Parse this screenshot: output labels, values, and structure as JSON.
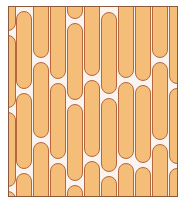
{
  "pattern": {
    "description": "Staggered capsule tile pattern",
    "colors": {
      "background": "#FBF3F0",
      "fill": "#F5BE78",
      "outline": "#B5683E",
      "frame": "#8B5A3C"
    },
    "frame": {
      "x": 8,
      "y": 6,
      "width": 170,
      "height": 191
    },
    "column_width": 16,
    "columns": [
      {
        "x": -9,
        "pills": [
          [
            -60,
            24
          ],
          [
            28,
            101
          ],
          [
            105,
            180
          ],
          [
            184,
            260
          ]
        ]
      },
      {
        "x": 7,
        "pills": [
          [
            4,
            82
          ],
          [
            86,
            162
          ],
          [
            166,
            240
          ]
        ]
      },
      {
        "x": 24,
        "pills": [
          [
            -30,
            51
          ],
          [
            55,
            131
          ],
          [
            135,
            212
          ]
        ]
      },
      {
        "x": 41,
        "pills": [
          [
            -10,
            72
          ],
          [
            76,
            152
          ],
          [
            156,
            232
          ]
        ]
      },
      {
        "x": 58,
        "pills": [
          [
            -60,
            12
          ],
          [
            16,
            93
          ],
          [
            97,
            174
          ],
          [
            178,
            250
          ]
        ]
      },
      {
        "x": 75,
        "pills": [
          [
            -10,
            69
          ],
          [
            73,
            150
          ],
          [
            154,
            230
          ]
        ]
      },
      {
        "x": 92,
        "pills": [
          [
            5,
            87
          ],
          [
            91,
            165
          ],
          [
            169,
            245
          ]
        ]
      },
      {
        "x": 109,
        "pills": [
          [
            -10,
            71
          ],
          [
            75,
            152
          ],
          [
            156,
            232
          ]
        ]
      },
      {
        "x": 126,
        "pills": [
          [
            -10,
            74
          ],
          [
            78,
            156
          ],
          [
            160,
            236
          ]
        ]
      },
      {
        "x": 143,
        "pills": [
          [
            -30,
            51
          ],
          [
            55,
            133
          ],
          [
            137,
            212
          ]
        ]
      },
      {
        "x": 160,
        "pills": [
          [
            -10,
            77
          ],
          [
            81,
            157
          ],
          [
            161,
            236
          ]
        ]
      }
    ]
  }
}
